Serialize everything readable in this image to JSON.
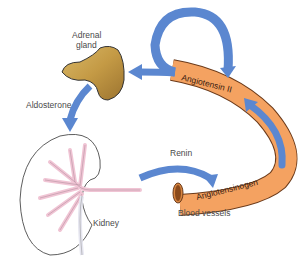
{
  "diagram": {
    "type": "renin-angiotensin-aldosterone system",
    "nodes": {
      "adrenal_gland": {
        "label_line1": "Adrenal",
        "label_line2": "gland"
      },
      "kidney": {
        "label": "Kidney"
      },
      "blood_vessels": {
        "label": "Blood vessels"
      },
      "angiotensin_ii": {
        "label": "Angiotensin II"
      },
      "angiotensinogen": {
        "label": "Angiotensinogen"
      }
    },
    "edges": {
      "aldosterone": {
        "label": "Aldosterone",
        "from": "Adrenal gland",
        "to": "Kidney"
      },
      "renin": {
        "label": "Renin",
        "from": "Kidney",
        "to": "Angiotensinogen"
      },
      "conversion": {
        "from": "Angiotensinogen",
        "to": "Angiotensin II"
      },
      "stimulate": {
        "from": "Angiotensin II",
        "to": "Adrenal gland"
      },
      "loop": {
        "from": "Angiotensin II",
        "to": "Angiotensin II"
      }
    },
    "colors": {
      "arrow": "#5b87d0",
      "vessel": "#f4a261",
      "vessel_outline": "#6b3a1a",
      "adrenal": "#c9a24a",
      "kidney_vessels": "#f0c4d4",
      "kidney_outline": "#333333"
    }
  }
}
